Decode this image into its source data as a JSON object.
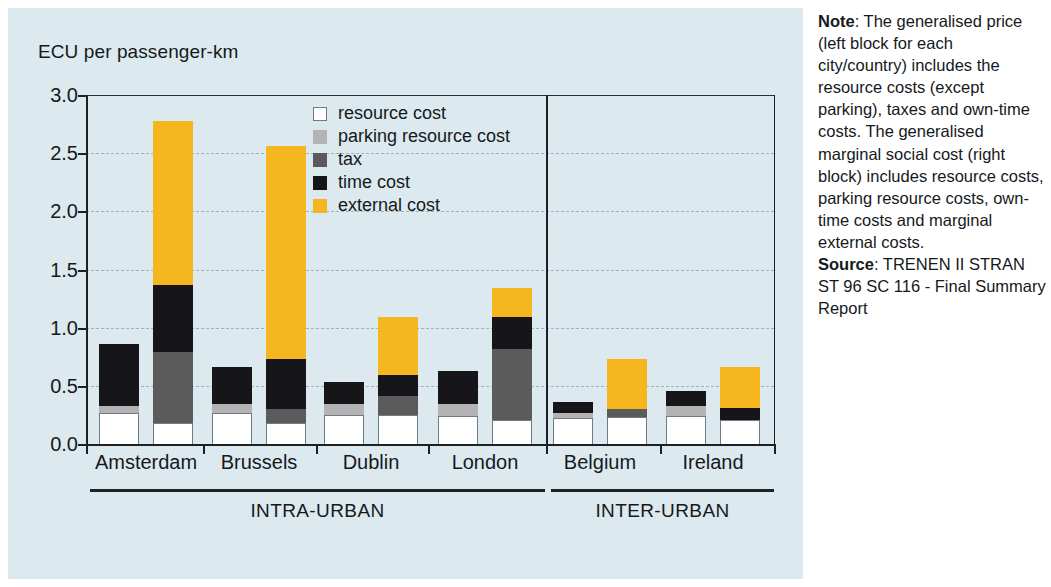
{
  "chart_data": {
    "type": "bar",
    "subtype": "stacked-grouped",
    "title": "",
    "ylabel": "ECU per passenger-km",
    "xlabel": "",
    "ylim": [
      0.0,
      3.0
    ],
    "ytick_labels": [
      "3.0",
      "2.5",
      "2.0",
      "1.5",
      "1.0",
      "0.5",
      "0.0"
    ],
    "ytick_values": [
      3.0,
      2.5,
      2.0,
      1.5,
      1.0,
      0.5,
      0.0
    ],
    "grid": "horizontal-dashed",
    "legend_position": "inside-top-center",
    "categories": [
      "Amsterdam",
      "Brussels",
      "Dublin",
      "London",
      "Belgium",
      "Ireland"
    ],
    "groups": [
      {
        "label": "INTRA-URBAN",
        "categories": [
          "Amsterdam",
          "Brussels",
          "Dublin",
          "London"
        ]
      },
      {
        "label": "INTER-URBAN",
        "categories": [
          "Belgium",
          "Ireland"
        ]
      }
    ],
    "series": [
      {
        "name": "resource cost",
        "color": "#ffffff"
      },
      {
        "name": "parking resource cost",
        "color": "#b3b3b3"
      },
      {
        "name": "tax",
        "color": "#5b5b5b"
      },
      {
        "name": "time cost",
        "color": "#16161a"
      },
      {
        "name": "external cost",
        "color": "#f5b620"
      }
    ],
    "bars": [
      {
        "category": "Amsterdam",
        "block": "generalised price",
        "segments": {
          "resource cost": 0.27,
          "parking resource cost": 0.06,
          "tax": 0.0,
          "time cost": 0.53,
          "external cost": 0.0
        },
        "total": 0.86
      },
      {
        "category": "Amsterdam",
        "block": "marginal social cost",
        "segments": {
          "resource cost": 0.18,
          "parking resource cost": 0.0,
          "tax": 0.61,
          "time cost": 0.58,
          "external cost": 1.41
        },
        "total": 2.78
      },
      {
        "category": "Brussels",
        "block": "generalised price",
        "segments": {
          "resource cost": 0.27,
          "parking resource cost": 0.07,
          "tax": 0.0,
          "time cost": 0.32,
          "external cost": 0.0
        },
        "total": 0.66
      },
      {
        "category": "Brussels",
        "block": "marginal social cost",
        "segments": {
          "resource cost": 0.18,
          "parking resource cost": 0.0,
          "tax": 0.12,
          "time cost": 0.43,
          "external cost": 1.83
        },
        "total": 2.56
      },
      {
        "category": "Dublin",
        "block": "generalised price",
        "segments": {
          "resource cost": 0.25,
          "parking resource cost": 0.09,
          "tax": 0.0,
          "time cost": 0.19,
          "external cost": 0.0
        },
        "total": 0.53
      },
      {
        "category": "Dublin",
        "block": "marginal social cost",
        "segments": {
          "resource cost": 0.25,
          "parking resource cost": 0.0,
          "tax": 0.16,
          "time cost": 0.18,
          "external cost": 0.5
        },
        "total": 1.09
      },
      {
        "category": "London",
        "block": "generalised price",
        "segments": {
          "resource cost": 0.24,
          "parking resource cost": 0.1,
          "tax": 0.0,
          "time cost": 0.29,
          "external cost": 0.0
        },
        "total": 0.63
      },
      {
        "category": "London",
        "block": "marginal social cost",
        "segments": {
          "resource cost": 0.21,
          "parking resource cost": 0.0,
          "tax": 0.61,
          "time cost": 0.27,
          "external cost": 0.25
        },
        "total": 1.34
      },
      {
        "category": "Belgium",
        "block": "generalised price",
        "segments": {
          "resource cost": 0.22,
          "parking resource cost": 0.05,
          "tax": 0.0,
          "time cost": 0.09,
          "external cost": 0.0
        },
        "total": 0.36
      },
      {
        "category": "Belgium",
        "block": "marginal social cost",
        "segments": {
          "resource cost": 0.23,
          "parking resource cost": 0.0,
          "tax": 0.07,
          "time cost": 0.0,
          "external cost": 0.43
        },
        "total": 0.73
      },
      {
        "category": "Ireland",
        "block": "generalised price",
        "segments": {
          "resource cost": 0.24,
          "parking resource cost": 0.09,
          "tax": 0.0,
          "time cost": 0.13,
          "external cost": 0.0
        },
        "total": 0.46
      },
      {
        "category": "Ireland",
        "block": "marginal social cost",
        "segments": {
          "resource cost": 0.21,
          "parking resource cost": 0.0,
          "tax": 0.0,
          "time cost": 0.1,
          "external cost": 0.35
        },
        "total": 0.66
      }
    ]
  },
  "axis": {
    "y_title": "ECU per passenger-km"
  },
  "legend": {
    "items": [
      {
        "label": "resource cost",
        "swatch": "resource"
      },
      {
        "label": "parking resource cost",
        "swatch": "parking"
      },
      {
        "label": "tax",
        "swatch": "tax"
      },
      {
        "label": "time cost",
        "swatch": "time"
      },
      {
        "label": "external cost",
        "swatch": "external"
      }
    ]
  },
  "note": {
    "heading": "Note",
    "heading_sep": ": ",
    "body": "The generalised price (left block for each city/country) includes the resource costs (except parking), taxes and own-time costs. The generalised marginal social cost (right block) includes resource costs, parking resource costs, own-time costs and marginal external costs.",
    "source_heading": "Source",
    "source_sep": ": ",
    "source_body": "TRENEN II STRAN ST 96 SC 116 - Final Summary Report"
  },
  "colors": {
    "panel_background": "#dce9ef",
    "external_cost": "#f5b620",
    "time_cost": "#16161a",
    "tax": "#5b5b5b",
    "parking_resource_cost": "#b3b3b3",
    "resource_cost": "#ffffff",
    "axis": "#1d2124"
  }
}
